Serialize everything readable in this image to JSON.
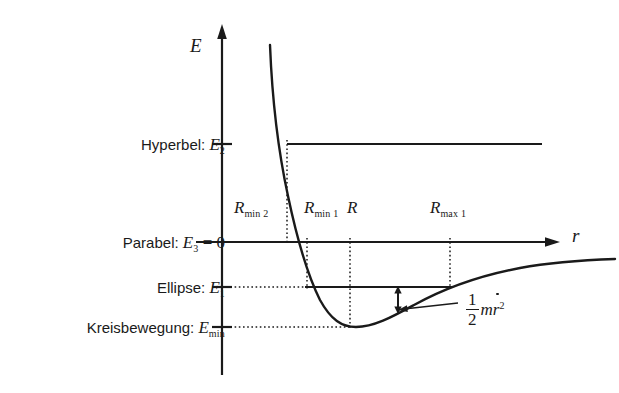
{
  "figure": {
    "axes": {
      "y_label": "E",
      "x_label": "r"
    },
    "level_labels": [
      {
        "name": "hyperbel",
        "text": "Hyperbel:",
        "symbol": "E",
        "subscript": "2",
        "suffix": ""
      },
      {
        "name": "parabel",
        "text": "Parabel:",
        "symbol": "E",
        "subscript": "3",
        "suffix": " = 0"
      },
      {
        "name": "ellipse",
        "text": "Ellipse:",
        "symbol": "E",
        "subscript": "1",
        "suffix": ""
      },
      {
        "name": "kreisbewegung",
        "text": "Kreisbewegung:",
        "symbol": "E",
        "subscript": "min",
        "suffix": ""
      }
    ],
    "radius_labels": [
      {
        "name": "r-min-2",
        "symbol": "R",
        "subscript": "min 2"
      },
      {
        "name": "r-min-1",
        "symbol": "R",
        "subscript": "min 1"
      },
      {
        "name": "r-equilibrium",
        "symbol": "R",
        "subscript": ""
      },
      {
        "name": "r-max-1",
        "symbol": "R",
        "subscript": "max 1"
      }
    ],
    "annotation": {
      "name": "kinetic-energy-formula",
      "numerator": "1",
      "denominator": "2",
      "body": "m",
      "variable": "r",
      "exponent": "2"
    },
    "colors": {
      "ink": "#1a1a1a",
      "background": "#ffffff"
    }
  },
  "chart_data": {
    "type": "line",
    "title": "",
    "xlabel": "r",
    "ylabel": "E",
    "grid": false,
    "legend": null,
    "axis_origin": {
      "x": 222,
      "y": 242
    },
    "energy_levels": [
      {
        "label": "E2",
        "kind": "hyperbel",
        "y": 144,
        "line_from_x": 287,
        "line_to_x": 542,
        "tick_x": 222,
        "style": "solid"
      },
      {
        "label": "E3",
        "kind": "parabel",
        "value": 0,
        "y": 242,
        "line_from_x": 222,
        "line_to_x": 560,
        "style": "axis"
      },
      {
        "label": "E1",
        "kind": "ellipse",
        "y": 287,
        "dotted_from_x": 222,
        "dotted_to_x": 307,
        "line_from_x": 307,
        "line_to_x": 450,
        "style": "dotted+solid"
      },
      {
        "label": "Emin",
        "kind": "kreisbewegung",
        "y": 327,
        "dotted_from_x": 222,
        "dotted_to_x": 350,
        "style": "dotted"
      }
    ],
    "radii": [
      {
        "label": "Rmin2",
        "x": 287,
        "from_y": 144,
        "to_y": 242,
        "label_pos": {
          "x": 236,
          "y": 205
        }
      },
      {
        "label": "Rmin1",
        "x": 307,
        "from_y": 242,
        "to_y": 287,
        "label_pos": {
          "x": 306,
          "y": 205
        }
      },
      {
        "label": "R",
        "x": 350,
        "from_y": 242,
        "to_y": 327,
        "label_pos": {
          "x": 348,
          "y": 205
        }
      },
      {
        "label": "Rmax1",
        "x": 450,
        "from_y": 242,
        "to_y": 287,
        "label_pos": {
          "x": 432,
          "y": 205
        }
      }
    ],
    "curve_points": [
      [
        270,
        45
      ],
      [
        272,
        70
      ],
      [
        275,
        100
      ],
      [
        278,
        125
      ],
      [
        281,
        148
      ],
      [
        284,
        170
      ],
      [
        288,
        195
      ],
      [
        292,
        218
      ],
      [
        296,
        238
      ],
      [
        300,
        255
      ],
      [
        305,
        272
      ],
      [
        311,
        288
      ],
      [
        318,
        302
      ],
      [
        326,
        313
      ],
      [
        335,
        321
      ],
      [
        345,
        326
      ],
      [
        355,
        327
      ],
      [
        368,
        326
      ],
      [
        382,
        321
      ],
      [
        398,
        313
      ],
      [
        415,
        304
      ],
      [
        435,
        294
      ],
      [
        455,
        285
      ],
      [
        478,
        277
      ],
      [
        500,
        271
      ],
      [
        530,
        266
      ],
      [
        560,
        263
      ],
      [
        590,
        261
      ],
      [
        615,
        259
      ]
    ],
    "double_arrow": {
      "x": 398,
      "top_y": 288,
      "bottom_y": 312,
      "meaning": "radial kinetic energy gap between E1 and V(r)"
    },
    "leader_line": {
      "from_x": 455,
      "from_y": 303,
      "to_x": 400,
      "to_y": 310
    }
  }
}
